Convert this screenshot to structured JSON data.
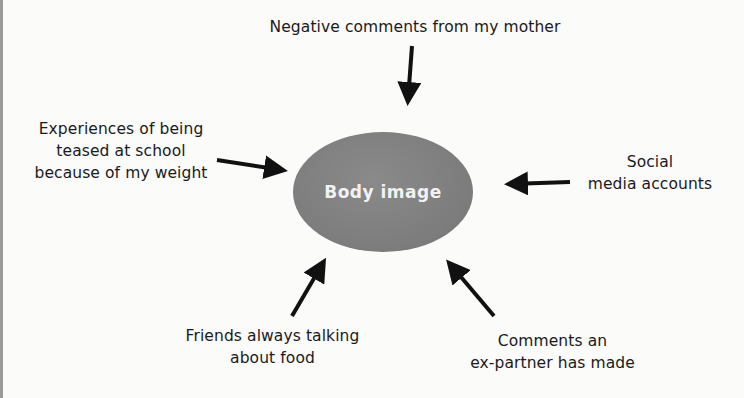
{
  "diagram": {
    "type": "influence-map",
    "center": {
      "label": "Body image",
      "color": "#7e7e7e"
    },
    "influences": [
      {
        "id": "top",
        "lines": [
          "Negative comments from my mother"
        ],
        "arrow_direction": "down"
      },
      {
        "id": "left",
        "lines": [
          "Experiences of being",
          "teased at school",
          "because of my weight"
        ],
        "arrow_direction": "right"
      },
      {
        "id": "right",
        "lines": [
          "Social",
          "media accounts"
        ],
        "arrow_direction": "left"
      },
      {
        "id": "bottom-left",
        "lines": [
          "Friends always talking",
          "about food"
        ],
        "arrow_direction": "up-right"
      },
      {
        "id": "bottom-right",
        "lines": [
          "Comments an",
          "ex-partner has made"
        ],
        "arrow_direction": "up-left"
      }
    ],
    "arrow_color": "#111111"
  }
}
